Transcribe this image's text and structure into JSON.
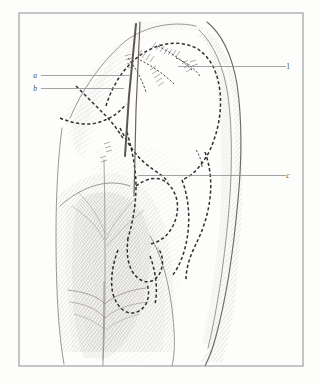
{
  "figure": {
    "frame": {
      "x": 19,
      "y": 13,
      "width": 284,
      "height": 353,
      "stroke_color": "#9a9a9a"
    },
    "background_color": "#fdfdfc",
    "ink_color": "#2f2f2f",
    "leader_color": "#8c8c8c"
  },
  "labels": [
    {
      "id": "label-a",
      "text": "a",
      "style": "italic",
      "side": "left",
      "text_x": 35,
      "text_y": 78,
      "leader": {
        "x1": 41,
        "y1": 75.5,
        "x2": 131,
        "y2": 75.5
      }
    },
    {
      "id": "label-b",
      "text": "b",
      "style": "italic",
      "side": "left",
      "text_x": 35,
      "text_y": 91,
      "leader": {
        "x1": 41,
        "y1": 88.5,
        "x2": 124,
        "y2": 88.5
      }
    },
    {
      "id": "label-1",
      "text": "1",
      "style": "roman",
      "side": "right",
      "text_x": 288,
      "text_y": 69,
      "leader": {
        "x1": 286,
        "y1": 66.5,
        "x2": 178,
        "y2": 66.5
      }
    },
    {
      "id": "label-c",
      "text": "c",
      "style": "italic",
      "side": "right",
      "text_x": 288,
      "text_y": 178,
      "leader": {
        "x1": 286,
        "y1": 175.5,
        "x2": 138,
        "y2": 175.5
      }
    }
  ],
  "legend_note": ""
}
